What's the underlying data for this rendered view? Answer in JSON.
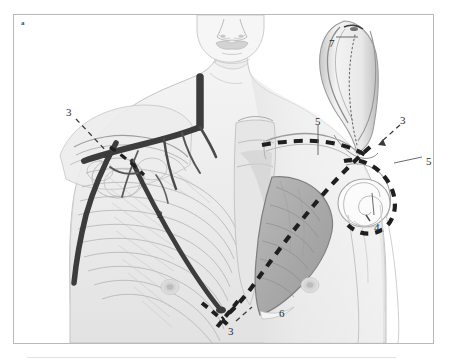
{
  "figure": {
    "panel_label": "a",
    "caption_rule_visible": true,
    "frame_color": "#b9b9b9",
    "background_color": "#ffffff"
  },
  "callouts": [
    {
      "id": "label-3-upper-left",
      "text": "3",
      "x": 52,
      "y": 92,
      "leader": "dashed",
      "target": "left infraclavicular / deltopectoral region"
    },
    {
      "id": "label-2-center-left",
      "text": "2",
      "x": 143,
      "y": 194,
      "leader": "none",
      "target": "axillary vessel tracing over lateral chest wall"
    },
    {
      "id": "label-3-bottom",
      "text": "3",
      "x": 214,
      "y": 311,
      "leader": "dashed",
      "target": "inferior sternal / costal margin crossing point"
    },
    {
      "id": "label-6-bottom",
      "text": "6",
      "x": 265,
      "y": 293,
      "leader": "none",
      "target": "pectoralis major shaded muscle belly"
    },
    {
      "id": "label-5-upper-mid",
      "text": "5",
      "x": 301,
      "y": 101,
      "leader": "solid",
      "target": "right clavicle"
    },
    {
      "id": "label-7-top-right",
      "text": "7",
      "x": 315,
      "y": 23,
      "leader": "solid",
      "target": "sternocleidomastoid / neck flap"
    },
    {
      "id": "label-3-upper-right",
      "text": "3",
      "x": 386,
      "y": 100,
      "leader": "dashed",
      "target": "right acromioclavicular region"
    },
    {
      "id": "label-5-right",
      "text": "5",
      "x": 412,
      "y": 141,
      "leader": "solid",
      "target": "right acromion / deltoid"
    },
    {
      "id": "label-4-right",
      "text": "4",
      "x": 360,
      "y": 207,
      "leader": "solid",
      "target": "right humeral head / glenohumeral joint"
    }
  ],
  "palette": {
    "skin_light": "#f2f2f2",
    "skin_mid": "#e4e4e4",
    "skin_shadow": "#d5d5d5",
    "bone_light": "#fbfbfb",
    "bone_outline": "#a8a8a8",
    "muscle_shade": "#b4b4b4",
    "muscle_dark": "#9a9a9a",
    "vessel_dark": "#3a3a3a",
    "incision_dash": "#1f1f1f",
    "line_thin": "#9e9e9e",
    "label_text": "#2b2b2b"
  }
}
